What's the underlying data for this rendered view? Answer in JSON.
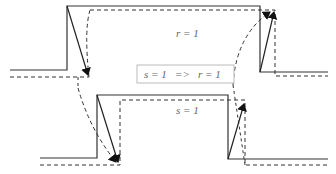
{
  "labels": {
    "top_signal": "r = 1",
    "bottom_signal": "s = 1",
    "implication": "s = 1   =>   r = 1"
  },
  "colors": {
    "solid_line": "#333333",
    "dashed_line": "#333333",
    "box_border": "#bbbbbb",
    "text": "#666666"
  }
}
